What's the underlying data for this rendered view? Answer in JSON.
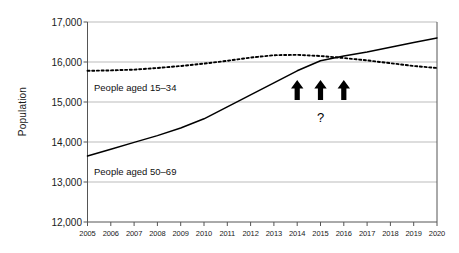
{
  "chart_data": {
    "type": "line",
    "title": "",
    "subtitle": "",
    "xlabel": "",
    "ylabel": "Population",
    "xlim": [
      2005,
      2020
    ],
    "ylim": [
      12000,
      17000
    ],
    "yticks": [
      12000,
      13000,
      14000,
      15000,
      16000,
      17000
    ],
    "ytick_labels": [
      "12,000",
      "13,000",
      "14,000",
      "15,000",
      "16,000",
      "17,000"
    ],
    "x": [
      2005,
      2006,
      2007,
      2008,
      2009,
      2010,
      2011,
      2012,
      2013,
      2014,
      2015,
      2016,
      2017,
      2018,
      2019,
      2020
    ],
    "xtick_labels": [
      "2005",
      "2006",
      "2007",
      "2008",
      "2009",
      "2010",
      "2011",
      "2012",
      "2013",
      "2014",
      "2015",
      "2016",
      "2017",
      "2018",
      "2019",
      "2020"
    ],
    "grid": "horizontal",
    "legend_position": "inline-labels",
    "series": [
      {
        "name": "People aged 15–34",
        "style": "dotted",
        "color": "#000000",
        "values": [
          15780,
          15790,
          15810,
          15850,
          15900,
          15960,
          16030,
          16110,
          16170,
          16180,
          16150,
          16100,
          16040,
          15970,
          15900,
          15850
        ]
      },
      {
        "name": "People aged 50–69",
        "style": "solid",
        "color": "#000000",
        "values": [
          13650,
          13820,
          13990,
          14160,
          14350,
          14580,
          14880,
          15180,
          15480,
          15780,
          16030,
          16150,
          16250,
          16370,
          16490,
          16600
        ]
      }
    ],
    "annotations": [
      {
        "name": "up-arrow",
        "x": 2014,
        "y": 15050,
        "symbol": "arrow-up"
      },
      {
        "name": "up-arrow",
        "x": 2015,
        "y": 15050,
        "symbol": "arrow-up"
      },
      {
        "name": "up-arrow",
        "x": 2016,
        "y": 15050,
        "symbol": "arrow-up"
      },
      {
        "name": "question-mark",
        "x": 2015,
        "y": 14600,
        "text": "?"
      }
    ]
  },
  "labels": {
    "series_15_34": "People aged 15–34",
    "series_50_69": "People aged 50–69",
    "question": "?"
  },
  "colors": {
    "line": "#000000",
    "grid": "#aaaaaa",
    "axis": "#555555",
    "text": "#1a1a1a",
    "background": "#ffffff"
  }
}
